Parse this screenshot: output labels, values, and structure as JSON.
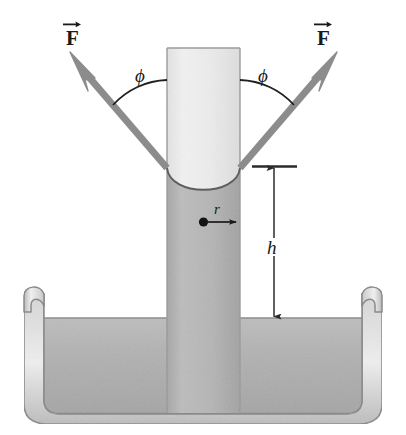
{
  "figure": {
    "background_color": "#ffffff"
  },
  "labels": {
    "force_left": "F",
    "force_right": "F",
    "phi_left": "ϕ",
    "phi_right": "ϕ",
    "height": "h",
    "radius": "r"
  },
  "colors": {
    "liquid_fill": "#b0b0b0",
    "liquid_fill_light": "#c6c6c6",
    "tube_air_fill": "#ededed",
    "tube_outline": "#8f8f8f",
    "vector_arrow": "#8c8c8c",
    "dimension_line": "#2b2b2b",
    "dish_glass": "#dcdcdc",
    "dish_outline": "#8a8a8a",
    "text": "#1a1a1a"
  },
  "geometry": {
    "tube_left_x": 167,
    "tube_right_x": 240,
    "tube_top_y": 48,
    "meniscus_bottom_y": 168,
    "dish_liquid_surface_y": 318,
    "dish_top_y": 296,
    "dish_bottom_y": 420,
    "h_arrow_x": 274,
    "h_top_y": 167,
    "h_bottom_y": 318,
    "radius_dot_x": 203,
    "radius_dot_y": 222,
    "radius_arrow_tip_x": 240
  },
  "annotations": {
    "force_vector_left_angle_deg": 135,
    "force_vector_right_angle_deg": 45,
    "contact_angle_symbol": "ϕ",
    "height_symbol": "h",
    "radius_symbol": "r"
  }
}
